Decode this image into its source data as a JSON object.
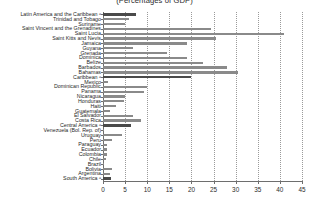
{
  "chart_data": {
    "type": "bar",
    "orientation": "horizontal",
    "title": "(Percentages of GDP)",
    "xlabel": "",
    "ylabel": "",
    "xlim": [
      0,
      45
    ],
    "xticks": [
      0,
      5,
      10,
      15,
      20,
      25,
      30,
      35,
      40,
      45
    ],
    "grid": "vertical-dotted",
    "legend": "none",
    "categories": [
      "Latin America and the Caribbean ᵃ",
      "Trinidad and Tobago",
      "Suriname",
      "Saint Vincent and the Grenadines",
      "Saint Lucia",
      "Saint Kitts and Nevis",
      "Jamaica",
      "Guyana",
      "Grenada",
      "Dominica",
      "Belize",
      "Barbados",
      "Bahamas",
      "Caribbean ᵃ",
      "Mexico",
      "Dominican Republic",
      "Panama",
      "Nicaragua",
      "Honduras",
      "Haiti",
      "Guatemala",
      "El Salvador",
      "Costa Rica",
      "Central America ᵃ",
      "Venezuela (Bol. Rep. of)",
      "Uruguay",
      "Peru",
      "Paraguay",
      "Ecuador",
      "Colombia",
      "Chile",
      "Brazil",
      "Bolivia",
      "Argentina",
      "South America ᵃ"
    ],
    "values": [
      7.5,
      5.8,
      5.0,
      24.5,
      41.0,
      25.5,
      19.0,
      6.8,
      14.5,
      19.0,
      22.5,
      28.0,
      30.5,
      20.0,
      1.2,
      10.0,
      9.3,
      5.0,
      4.8,
      3.0,
      1.5,
      6.8,
      8.5,
      6.3,
      0.3,
      4.4,
      2.0,
      0.9,
      0.8,
      0.8,
      0.7,
      0.3,
      2.0,
      1.5,
      1.8
    ],
    "aggregate_flags": [
      true,
      false,
      false,
      false,
      false,
      false,
      false,
      false,
      false,
      false,
      false,
      false,
      false,
      true,
      false,
      false,
      false,
      false,
      false,
      false,
      false,
      false,
      false,
      true,
      false,
      false,
      false,
      false,
      false,
      false,
      false,
      false,
      false,
      false,
      true
    ],
    "colors": {
      "bar": "#8a8a8a",
      "bar_aggregate": "#4a4a4a",
      "axis": "#6e6e6e",
      "grid": "#9a9a9a",
      "text": "#1f1f1f",
      "background": "#ffffff"
    }
  }
}
